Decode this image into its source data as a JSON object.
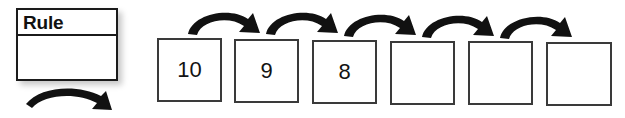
{
  "worksheet": {
    "title": "Number pattern rule worksheet",
    "background_color": "#ffffff",
    "ink_color": "#111111",
    "box_border_color": "#3a3a3a"
  },
  "rule_box": {
    "label": "Rule",
    "value": "",
    "value_placeholder": ""
  },
  "arrows": {
    "rule_arrow_name": "rule-to-sequence-arrow",
    "count_between_boxes": 5
  },
  "sequence": {
    "cells": [
      {
        "value": "10",
        "filled": true
      },
      {
        "value": "9",
        "filled": true
      },
      {
        "value": "8",
        "filled": true
      },
      {
        "value": "",
        "filled": false
      },
      {
        "value": "",
        "filled": false
      },
      {
        "value": "",
        "filled": false
      }
    ]
  }
}
